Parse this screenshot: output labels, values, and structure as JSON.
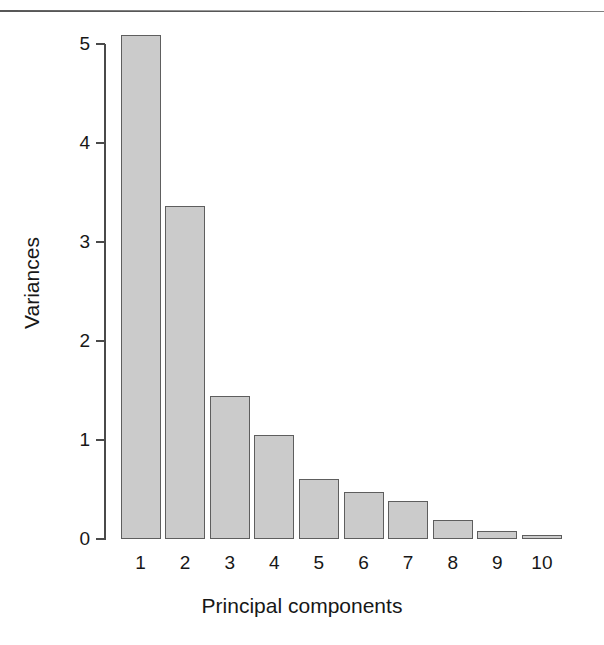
{
  "figure": {
    "has_top_rule": true,
    "background_color": "#ffffff",
    "bar_fill_color": "#cbcbcb",
    "bar_border_color": "#5e5e5e",
    "axis_color": "#4a4a4a",
    "text_color": "#171717"
  },
  "chart_data": {
    "type": "bar",
    "title": "",
    "subtitle": "",
    "xlabel": "Principal components",
    "ylabel": "Variances",
    "categories": [
      "1",
      "2",
      "3",
      "4",
      "5",
      "6",
      "7",
      "8",
      "9",
      "10"
    ],
    "values": [
      5.09,
      3.36,
      1.44,
      1.05,
      0.61,
      0.47,
      0.38,
      0.19,
      0.08,
      0.04
    ],
    "ylim": [
      0,
      5.3
    ],
    "yticks": [
      0,
      1,
      2,
      3,
      4,
      5
    ],
    "ytick_labels": [
      "0",
      "1",
      "2",
      "3",
      "4",
      "5"
    ],
    "xtick_labels": [
      "1",
      "2",
      "3",
      "4",
      "5",
      "6",
      "7",
      "8",
      "9",
      "10"
    ],
    "grid": false,
    "legend": false,
    "legend_position": "none",
    "annotations": []
  }
}
